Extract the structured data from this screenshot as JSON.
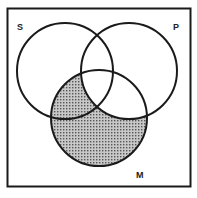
{
  "diagram": {
    "type": "venn",
    "sets": [
      {
        "id": "S",
        "label": "S",
        "cx": 65,
        "cy": 71,
        "r": 48
      },
      {
        "id": "P",
        "label": "P",
        "cx": 129,
        "cy": 71,
        "r": 48
      },
      {
        "id": "M",
        "label": "M",
        "cx": 99,
        "cy": 118,
        "r": 48
      }
    ],
    "shaded_region": "M minus P",
    "colors": {
      "stroke": "#1a1a1a",
      "shade": "#9a9a9a",
      "background": "#ffffff"
    }
  }
}
